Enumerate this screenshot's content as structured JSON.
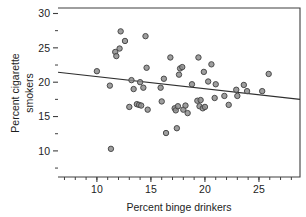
{
  "chart_data": {
    "type": "scatter",
    "title": "",
    "xlabel": "Percent binge drinkers",
    "ylabel_line1": "Percent cigarette",
    "ylabel_line2": "smokers",
    "xlim": [
      6.4,
      28.8
    ],
    "ylim": [
      6.2,
      30.8
    ],
    "xticks": [
      10,
      15,
      20,
      25
    ],
    "xtick_labels": [
      "10",
      "15",
      "20",
      "25"
    ],
    "xminor_ticks": [
      7,
      8,
      9,
      10,
      11,
      12,
      13,
      14,
      15,
      16,
      17,
      18,
      19,
      20,
      21,
      22,
      23,
      24,
      25,
      26,
      27,
      28
    ],
    "yticks": [
      10,
      15,
      20,
      25,
      30
    ],
    "ytick_labels": [
      "10",
      "15",
      "20",
      "25",
      "30"
    ],
    "yminor_ticks": [
      7.5,
      12.5,
      17.5,
      22.5,
      27.5
    ],
    "grid": false,
    "legend": "none",
    "marker": "open-circle",
    "marker_color": "#8d8d8d",
    "marker_edge_color": "#4a4a4a",
    "line_color": "#2e2e2e",
    "frame_color": "#3f3f3f",
    "fit_line": {
      "label": "least-squares regression line",
      "x_start": 6.4,
      "y_start": 21.45,
      "x_end": 28.8,
      "y_end": 17.5,
      "slope": -0.176,
      "intercept": 22.58
    },
    "points": [
      [
        10.0,
        21.6
      ],
      [
        11.2,
        19.5
      ],
      [
        11.3,
        10.3
      ],
      [
        11.7,
        24.4
      ],
      [
        11.8,
        23.8
      ],
      [
        12.1,
        24.9
      ],
      [
        12.2,
        27.4
      ],
      [
        12.6,
        26.0
      ],
      [
        13.0,
        16.4
      ],
      [
        13.2,
        20.3
      ],
      [
        13.4,
        19.0
      ],
      [
        13.7,
        16.8
      ],
      [
        13.9,
        16.7
      ],
      [
        14.0,
        20.0
      ],
      [
        14.1,
        16.6
      ],
      [
        14.3,
        19.2
      ],
      [
        14.5,
        26.7
      ],
      [
        14.6,
        22.1
      ],
      [
        14.7,
        16.0
      ],
      [
        15.9,
        19.2
      ],
      [
        16.0,
        17.2
      ],
      [
        16.2,
        20.5
      ],
      [
        16.4,
        12.6
      ],
      [
        16.8,
        23.6
      ],
      [
        17.2,
        16.2
      ],
      [
        17.3,
        15.9
      ],
      [
        17.4,
        13.3
      ],
      [
        17.5,
        16.5
      ],
      [
        17.6,
        21.1
      ],
      [
        17.7,
        22.0
      ],
      [
        17.9,
        22.2
      ],
      [
        18.0,
        16.0
      ],
      [
        18.2,
        16.6
      ],
      [
        18.4,
        15.5
      ],
      [
        18.8,
        19.7
      ],
      [
        19.3,
        17.3
      ],
      [
        19.4,
        23.6
      ],
      [
        19.5,
        16.5
      ],
      [
        19.6,
        17.4
      ],
      [
        19.8,
        16.2
      ],
      [
        19.9,
        21.5
      ],
      [
        20.0,
        16.4
      ],
      [
        20.3,
        20.1
      ],
      [
        20.6,
        22.6
      ],
      [
        20.9,
        17.7
      ],
      [
        21.0,
        19.7
      ],
      [
        21.8,
        18.0
      ],
      [
        22.2,
        16.7
      ],
      [
        22.9,
        18.9
      ],
      [
        23.0,
        18.0
      ],
      [
        23.6,
        19.6
      ],
      [
        23.9,
        18.7
      ],
      [
        25.3,
        18.7
      ],
      [
        25.9,
        21.2
      ]
    ]
  }
}
